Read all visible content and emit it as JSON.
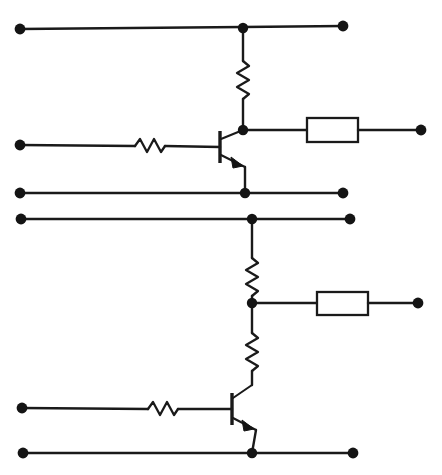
{
  "diagram": {
    "kind": "electronic-schematic",
    "canvas": {
      "width": 442,
      "height": 475,
      "background": "#ffffff"
    },
    "style": {
      "wire_color": "#1a1a1a",
      "node_color": "#141414",
      "box_fill": "#ffffff",
      "wire_width": 2.4
    },
    "stages": [
      {
        "name": "upper-stage",
        "device": "npn-transistor",
        "components": [
          {
            "type": "resistor",
            "orientation": "vertical",
            "label": "collector-resistor"
          },
          {
            "type": "resistor",
            "orientation": "horizontal",
            "label": "base-resistor"
          },
          {
            "type": "box",
            "orientation": "horizontal",
            "label": "output-box"
          }
        ],
        "rails": [
          "supply-rail",
          "base-rail",
          "ground-rail"
        ]
      },
      {
        "name": "lower-stage",
        "device": "npn-transistor",
        "components": [
          {
            "type": "resistor",
            "orientation": "vertical",
            "label": "upper-divider-resistor"
          },
          {
            "type": "resistor",
            "orientation": "vertical",
            "label": "lower-divider-resistor"
          },
          {
            "type": "resistor",
            "orientation": "horizontal",
            "label": "base-resistor"
          },
          {
            "type": "box",
            "orientation": "horizontal",
            "label": "output-box"
          }
        ],
        "rails": [
          "supply-rail",
          "base-rail",
          "ground-rail"
        ]
      }
    ],
    "terminals": {
      "count": 13,
      "left": [
        {
          "name": "upper-supply-left",
          "x": 20,
          "y": 29
        },
        {
          "name": "upper-base-left",
          "x": 20,
          "y": 145
        },
        {
          "name": "upper-ground-left",
          "x": 20,
          "y": 193
        },
        {
          "name": "lower-supply-left",
          "x": 21,
          "y": 219
        },
        {
          "name": "lower-base-left",
          "x": 22,
          "y": 408
        },
        {
          "name": "lower-ground-left",
          "x": 23,
          "y": 453
        }
      ],
      "right": [
        {
          "name": "upper-supply-right",
          "x": 343,
          "y": 26
        },
        {
          "name": "upper-output-right",
          "x": 421,
          "y": 130
        },
        {
          "name": "upper-ground-right",
          "x": 343,
          "y": 193
        },
        {
          "name": "lower-supply-right",
          "x": 350,
          "y": 219
        },
        {
          "name": "lower-output-right",
          "x": 418,
          "y": 303
        },
        {
          "name": "lower-ground-right",
          "x": 353,
          "y": 453
        }
      ]
    },
    "junctions": [
      {
        "name": "upper-supply-node",
        "x": 243,
        "y": 28
      },
      {
        "name": "upper-collector-node",
        "x": 243,
        "y": 130
      },
      {
        "name": "upper-emitter-node",
        "x": 245,
        "y": 193
      },
      {
        "name": "lower-supply-node",
        "x": 252,
        "y": 219
      },
      {
        "name": "lower-divider-node",
        "x": 252,
        "y": 303
      },
      {
        "name": "lower-emitter-node",
        "x": 252,
        "y": 453
      }
    ]
  }
}
